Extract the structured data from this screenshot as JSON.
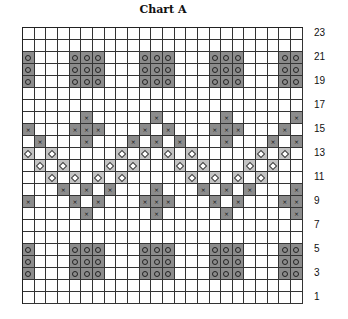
{
  "title": "Chart A",
  "grid": {
    "columns": 24,
    "rows": 23,
    "colors": {
      "dark": "#8c8c8c",
      "light": "#c4c4c4",
      "empty": "#ffffff",
      "line": "#333333"
    },
    "symbols": {
      "o": "circle",
      "x": "cross",
      "d": "diamond"
    },
    "row_data": {
      "23": {},
      "22": {},
      "21": {
        "o": [
          0,
          4,
          5,
          6,
          10,
          11,
          12,
          16,
          17,
          18,
          22,
          23
        ]
      },
      "20": {
        "o": [
          0,
          4,
          5,
          6,
          10,
          11,
          12,
          16,
          17,
          18,
          22,
          23
        ]
      },
      "19": {
        "o": [
          0,
          4,
          5,
          6,
          10,
          11,
          12,
          16,
          17,
          18,
          22,
          23
        ]
      },
      "18": {},
      "17": {},
      "16": {
        "x": [
          5,
          11,
          17,
          23
        ]
      },
      "15": {
        "x": [
          0,
          4,
          5,
          6,
          10,
          12,
          16,
          17,
          18,
          22
        ]
      },
      "14": {
        "x": [
          1,
          5,
          9,
          11,
          13,
          17,
          21,
          23
        ]
      },
      "13": {
        "d": [
          0,
          2,
          8,
          10,
          12,
          14,
          20,
          22
        ]
      },
      "12": {
        "d": [
          1,
          3,
          7,
          9,
          13,
          15,
          19,
          21
        ]
      },
      "11": {
        "d": [
          2,
          4,
          6,
          8,
          14,
          16,
          18,
          20
        ]
      },
      "10": {
        "x": [
          3,
          5,
          7,
          11,
          15,
          17,
          19,
          23
        ]
      },
      "9": {
        "x": [
          0,
          4,
          6,
          10,
          11,
          12,
          16,
          18,
          22,
          23
        ]
      },
      "8": {
        "x": [
          5,
          11,
          17,
          23
        ]
      },
      "7": {},
      "6": {},
      "5": {
        "o": [
          0,
          4,
          5,
          6,
          10,
          11,
          12,
          16,
          17,
          18,
          22,
          23
        ]
      },
      "4": {
        "o": [
          0,
          4,
          5,
          6,
          10,
          11,
          12,
          16,
          17,
          18,
          22,
          23
        ]
      },
      "3": {
        "o": [
          0,
          4,
          5,
          6,
          10,
          11,
          12,
          16,
          17,
          18,
          22,
          23
        ]
      },
      "2": {},
      "1": {}
    }
  },
  "row_labels": [
    "23",
    "21",
    "19",
    "17",
    "15",
    "13",
    "11",
    "9",
    "7",
    "5",
    "3",
    "1"
  ]
}
